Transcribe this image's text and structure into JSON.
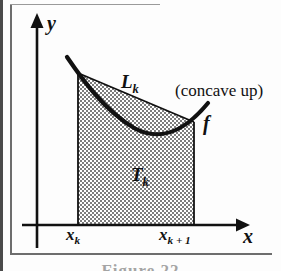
{
  "figure": {
    "kind": "trapezoid-rule-diagram",
    "caption_partial": "Figure 22",
    "colors": {
      "ink": "#111111",
      "shade_fill": "#aaaaaa",
      "gutter": "#4a4a4a",
      "frame": "#6d6d6d",
      "background": "#fdfdfd"
    },
    "axes": {
      "x_label": "x",
      "y_label": "y",
      "origin": {
        "x": 37,
        "y": 225
      },
      "x_axis_end": {
        "x": 240,
        "y": 225
      },
      "y_axis_top": {
        "x": 37,
        "y": 18
      },
      "y_axis_bottom": {
        "x": 37,
        "y": 248
      },
      "arrowheads": [
        "x-axis-right",
        "y-axis-top"
      ]
    },
    "tick_labels": {
      "left": {
        "base": "x",
        "sub": "k"
      },
      "right": {
        "base": "x",
        "sub": "k + 1"
      }
    },
    "curve": {
      "name": "f",
      "label": "f",
      "shape": "concave up",
      "annotation": "(concave up)",
      "path_points": [
        {
          "x": 67,
          "y": 57
        },
        {
          "x": 78,
          "y": 73
        },
        {
          "x": 104,
          "y": 104
        },
        {
          "x": 132,
          "y": 127
        },
        {
          "x": 160,
          "y": 138
        },
        {
          "x": 180,
          "y": 134
        },
        {
          "x": 194,
          "y": 122
        },
        {
          "x": 207,
          "y": 104
        }
      ]
    },
    "chord": {
      "label": "L",
      "sub": "k",
      "from": {
        "x": 78,
        "y": 73
      },
      "to": {
        "x": 194,
        "y": 122
      }
    },
    "region": {
      "label": "T",
      "sub": "k",
      "description": "shaded trapezoid between chord and x-axis",
      "vertices": [
        {
          "x": 78,
          "y": 73
        },
        {
          "x": 194,
          "y": 122
        },
        {
          "x": 194,
          "y": 225
        },
        {
          "x": 78,
          "y": 225
        }
      ]
    }
  }
}
